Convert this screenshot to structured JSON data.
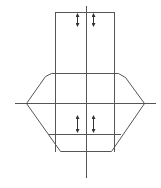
{
  "diagram": {
    "type": "technical-line-drawing",
    "colors": {
      "background": "#ffffff",
      "line": "#555555",
      "arrow": "#333333"
    },
    "axes": {
      "vertical": {
        "x": 86,
        "y1": 6,
        "y2": 178
      },
      "horizontal": {
        "y": 103,
        "x1": 15,
        "x2": 156
      }
    },
    "upper_rect": {
      "x1": 55,
      "x2": 114,
      "y1": 12,
      "y2": 73
    },
    "body": {
      "points": [
        [
          26,
          103
        ],
        [
          45,
          76
        ],
        [
          51,
          73
        ],
        [
          118,
          73
        ],
        [
          125,
          77
        ],
        [
          144,
          103
        ],
        [
          111,
          151
        ],
        [
          60,
          151
        ]
      ],
      "inner_line": {
        "y": 134,
        "x1": 48,
        "x2": 120
      },
      "inner_verticals": [
        55,
        114
      ]
    },
    "arrows": [
      {
        "name": "upper-left",
        "x": 77,
        "y1": 13,
        "y2": 27
      },
      {
        "name": "upper-right",
        "x": 93,
        "y1": 13,
        "y2": 27
      },
      {
        "name": "lower-left",
        "x": 77,
        "y1": 115,
        "y2": 133
      },
      {
        "name": "lower-right",
        "x": 93,
        "y1": 115,
        "y2": 133
      }
    ]
  }
}
